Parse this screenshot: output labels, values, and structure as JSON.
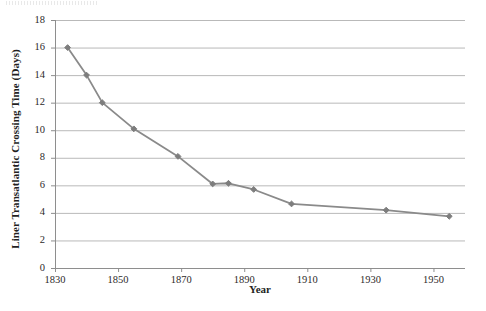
{
  "chart_data": {
    "type": "line",
    "title": "",
    "xlabel": "Year",
    "ylabel": "Liner Transatlantic Crossing Time (Days)",
    "xlim": [
      1830,
      1960
    ],
    "ylim": [
      0,
      18
    ],
    "grid": true,
    "legend": false,
    "x_ticks": [
      1830,
      1850,
      1870,
      1890,
      1910,
      1930,
      1950
    ],
    "y_ticks": [
      0,
      2,
      4,
      6,
      8,
      10,
      12,
      14,
      16,
      18
    ],
    "marker": "diamond",
    "series": [
      {
        "name": "Liner Transatlantic Crossing Time",
        "color": "#8a8a8a",
        "points": [
          {
            "x": 1834,
            "y": 16
          },
          {
            "x": 1840,
            "y": 14
          },
          {
            "x": 1845,
            "y": 12
          },
          {
            "x": 1855,
            "y": 10.1
          },
          {
            "x": 1869,
            "y": 8.1
          },
          {
            "x": 1880,
            "y": 6.1
          },
          {
            "x": 1885,
            "y": 6.15
          },
          {
            "x": 1893,
            "y": 5.7
          },
          {
            "x": 1905,
            "y": 4.65
          },
          {
            "x": 1935,
            "y": 4.2
          },
          {
            "x": 1955,
            "y": 3.75
          }
        ]
      }
    ]
  },
  "axis": {
    "x_tick_labels": [
      "1830",
      "1850",
      "1870",
      "1890",
      "1910",
      "1930",
      "1950"
    ],
    "y_tick_labels": [
      "0",
      "2",
      "4",
      "6",
      "8",
      "10",
      "12",
      "14",
      "16",
      "18"
    ]
  },
  "style": {
    "line_color": "#8a8a8a",
    "marker_color": "#7d7d7d",
    "grid_color": "#b9b9b9",
    "axis_color": "#8e8e8e",
    "text_color": "#231f1f"
  }
}
